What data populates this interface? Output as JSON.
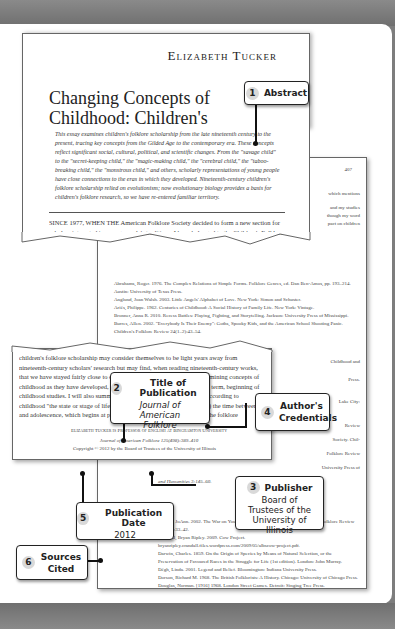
{
  "article": {
    "author": "Elizabeth Tucker",
    "title": "Changing Concepts of Childhood: Children's Folklore Scholarship since the Late Nineteenth Century",
    "abstract": "This essay examines children's folklore scholarship from the late nineteenth century to the present, tracing key concepts from the Gilded Age to the contemporary era. These concepts reflect significant social, cultural, political, and scientific changes. From the \"savage child\" to the \"secret-keeping child,\" the \"magic-making child,\" the \"cerebral child,\" the \"taboo-breaking child,\" the \"monstrous child,\" and others, scholarly representations of young people have close connections to the eras in which they developed. Nineteenth-century children's folklore scholarship relied on evolutionism; now evolutionary biology provides a basis for children's folklore research, so we have re-entered familiar territory.",
    "intro": "SINCE 1977, WHEN THE American Folklore Society decided to form a new section for scholars interested in young people's traditions, I have belonged to the Children's Folklore Section. It has been a joy to contribute to this dynamic organization, which",
    "mid_text": "children's folklore scholarship may consider themselves to be light years away from nineteenth-century scholars' research but may find, when reading nineteenth-century works, that we have stayed fairly close to our scholarly \"home base.\" Before examining concepts of childhood as they have developed, I will offer a working definition of the term, beginning of childhood studies. I will also summarize work during thirty-four years. According to childhood \"the state or stage of life of a child; the birth to puberty\" (2011) the time between and adolescence, which begins at puberty and follows pre-adolescence. The folklore",
    "credentials": "Elizabeth Tucker is Professor of English at Binghamton University",
    "journal_line": "Journal of American Folklore 125(498):389–410",
    "copyright": "Copyright © 2012 by the Board of Trustees of the University of Illinois",
    "page_number": "407",
    "right_snippets": [
      "which mentions",
      "and my studies",
      "though my word",
      "pact on children",
      "8).",
      "Childhood and",
      "Press.",
      "Appleton.",
      "Lake City:",
      "Review",
      "Society. Chil-",
      "Folklore Review",
      "University Press of",
      "Social Sciences",
      "ts and Col-",
      "Macmillan.",
      "ponsibility."
    ],
    "references": [
      "Abrahams, Roger. 1976. The Complex Relations of Simple Forms. Folklore Genres, ed. Dan Ben-Amos, pp. 193–214. Austin: University of Texas Press.",
      "Anglund, Joan Walsh. 2003. Little Angels' Alphabet of Love. New York: Simon and Schuster.",
      "Ariès, Philippe. 1962. Centuries of Childhood: A Social History of Family Life. New York: Vintage.",
      "Bronner, Anna R. 2010. Recess Battles: Playing, Fighting, and Storytelling. Jackson: University Press of Mississippi.",
      "Burres, Allen. 2002. \"Everybody Is Their Enemy\": Goths, Spooky Kids, and the American School Shooting Panic. Children's Folklore Review 24(1–2):43–54.",
      "and Humanities 3:145–60.",
      "Carpenter, Carole H. 2011. Why Children's Studies? .../pdf/papers/Carole.Carp...",
      "...1996. The Child and ...",
      "...Fay. 1990. Parenting with ...",
      "...Pinon Press.",
      "Conrad, JoAnn. 2002. The War on Youth: A Modern Oedipal Tragedy. Children's Folklore Review 24(1–2):33–42.",
      "Crandall, Bryan Ripley. 2009. Cow Project. bryanripley.crandall.files.wordpress.com/2009/05/albscow-project.pdf.",
      "Darwin, Charles. 1859. On the Origin of Species by Means of Natural Selection, or the Preservation of Favoured Races in the Struggle for Life (1st edition). London: John Murray.",
      "Dégh, Linda. 2001. Legend and Belief. Bloomington: Indiana University Press.",
      "Dorson, Richard M. 1968. The British Folklorists: A History. Chicago: University of Chicago Press.",
      "Douglas, Norman. [1916] 1968. London Street Games. Detroit: Singing Tree Press."
    ]
  },
  "callouts": [
    {
      "number": "1",
      "label": "Abstract"
    },
    {
      "number": "2",
      "label": "Title of Publication",
      "detail": "Journal of American Folklore"
    },
    {
      "number": "3",
      "label": "Publisher",
      "detail": "Board of Trustees of the University of Illinois"
    },
    {
      "number": "4",
      "label": "Author's Credentials"
    },
    {
      "number": "5",
      "label": "Publication Date",
      "detail": "2012"
    },
    {
      "number": "6",
      "label": "Sources Cited"
    }
  ]
}
